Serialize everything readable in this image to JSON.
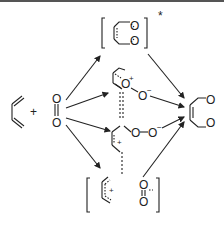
{
  "diagram": {
    "reactants": {
      "diene": "butadiene",
      "plus": "+",
      "oxygen": {
        "top": "O",
        "bottom": "O"
      }
    },
    "intermediates": {
      "concerted_ts": {
        "atoms": [
          "O",
          "O"
        ],
        "mark": "*"
      },
      "perepoxide": {
        "o_plus": "O",
        "charge_plus": "+",
        "o_minus": "O",
        "charge_minus": "−"
      },
      "zwitterion": {
        "o1": "O",
        "o2": "O",
        "charge_minus": "−",
        "charge_plus": "+"
      },
      "radical_pair": {
        "charge_plus": "+",
        "o_top": "O",
        "o_bottom": "O",
        "charge_minus": "−"
      }
    },
    "product": {
      "atoms": [
        "O",
        "O"
      ],
      "name": "3,6-dihydro-1,2-dioxine"
    },
    "colors": {
      "line": "#222222",
      "background": "#ffffff"
    }
  }
}
